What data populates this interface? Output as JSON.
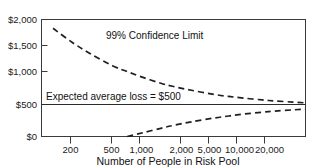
{
  "chart_data": {
    "type": "line",
    "title": "",
    "xlabel": "Number of People in Risk Pool",
    "ylabel": "",
    "xscale": "log",
    "xlim": [
      100,
      40000
    ],
    "ylim": [
      0,
      2000
    ],
    "grid": false,
    "legend_position": "inline-annotations",
    "xticks": [
      200,
      500,
      1000,
      2000,
      5000,
      10000,
      20000
    ],
    "xtick_labels": [
      "200",
      "500",
      "1,000",
      "2,000",
      "5,000",
      "10,000",
      "20,000"
    ],
    "yticks": [
      0,
      500,
      1000,
      1500,
      2000
    ],
    "ytick_labels": [
      "$0",
      "$500",
      "$1,000",
      "$1,500",
      "$2,000"
    ],
    "annotations": [
      {
        "name": "confidence-limit-label",
        "text": "99% Confidence Limit",
        "x": 1400,
        "y": 1520
      },
      {
        "name": "expected-loss-label",
        "text": "Expected average loss = $500",
        "x": 260,
        "y": 560
      }
    ],
    "series": [
      {
        "name": "99% Confidence Limit (upper)",
        "style": "dashed",
        "x": [
          130,
          200,
          300,
          500,
          700,
          1000,
          1500,
          2000,
          3000,
          5000,
          7000,
          10000,
          15000,
          20000,
          30000,
          40000
        ],
        "values": [
          1850,
          1610,
          1420,
          1210,
          1110,
          1010,
          910,
          855,
          790,
          720,
          685,
          655,
          625,
          608,
          588,
          575
        ]
      },
      {
        "name": "99% Confidence Limit (lower)",
        "style": "dashed",
        "x": [
          700,
          1000,
          1500,
          2000,
          3000,
          5000,
          7000,
          10000,
          15000,
          20000,
          30000,
          40000
        ],
        "values": [
          0,
          65,
          140,
          190,
          250,
          315,
          350,
          385,
          415,
          435,
          455,
          470
        ]
      },
      {
        "name": "Expected average loss",
        "style": "solid",
        "x": [
          100,
          40000
        ],
        "values": [
          500,
          500
        ]
      }
    ]
  },
  "colors": {
    "curve": "#1f1f1f",
    "frame": "#3a3a3a",
    "mean_line": "#2b2b2b",
    "text": "#111111",
    "background": "#ffffff"
  }
}
